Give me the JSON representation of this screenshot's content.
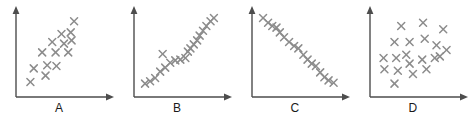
{
  "figure": {
    "background_color": "#ffffff",
    "marker_color": "#8c8c8c",
    "axis_color": "#4d4d4d",
    "label_color": "#1a1a1a",
    "marker_glyph": "x-cross",
    "panel_count": 4
  },
  "chart_data": [
    {
      "type": "scatter",
      "title": "A",
      "xlabel": "",
      "ylabel": "",
      "xlim": [
        0,
        100
      ],
      "ylim": [
        0,
        100
      ],
      "grid": false,
      "legend": "none",
      "annotation": "moderate positive correlation",
      "points": [
        {
          "x": 10,
          "y": 10
        },
        {
          "x": 14,
          "y": 27
        },
        {
          "x": 28,
          "y": 18
        },
        {
          "x": 30,
          "y": 31
        },
        {
          "x": 41,
          "y": 30
        },
        {
          "x": 24,
          "y": 47
        },
        {
          "x": 40,
          "y": 47
        },
        {
          "x": 55,
          "y": 47
        },
        {
          "x": 36,
          "y": 60
        },
        {
          "x": 50,
          "y": 58
        },
        {
          "x": 47,
          "y": 70
        },
        {
          "x": 58,
          "y": 72
        },
        {
          "x": 62,
          "y": 86
        },
        {
          "x": 59,
          "y": 62
        }
      ]
    },
    {
      "type": "scatter",
      "title": "B",
      "xlabel": "",
      "ylabel": "",
      "xlim": [
        0,
        100
      ],
      "ylim": [
        0,
        100
      ],
      "grid": false,
      "legend": "none",
      "annotation": "strong positive correlation",
      "points": [
        {
          "x": 6,
          "y": 8
        },
        {
          "x": 12,
          "y": 11
        },
        {
          "x": 18,
          "y": 15
        },
        {
          "x": 24,
          "y": 23
        },
        {
          "x": 30,
          "y": 28
        },
        {
          "x": 27,
          "y": 45
        },
        {
          "x": 36,
          "y": 34
        },
        {
          "x": 42,
          "y": 37
        },
        {
          "x": 48,
          "y": 38
        },
        {
          "x": 54,
          "y": 40
        },
        {
          "x": 57,
          "y": 48
        },
        {
          "x": 60,
          "y": 52
        },
        {
          "x": 64,
          "y": 57
        },
        {
          "x": 68,
          "y": 62
        },
        {
          "x": 71,
          "y": 68
        },
        {
          "x": 75,
          "y": 74
        },
        {
          "x": 79,
          "y": 80
        },
        {
          "x": 84,
          "y": 86
        },
        {
          "x": 88,
          "y": 90
        }
      ]
    },
    {
      "type": "scatter",
      "title": "C",
      "xlabel": "",
      "ylabel": "",
      "xlim": [
        0,
        100
      ],
      "ylim": [
        0,
        100
      ],
      "grid": false,
      "legend": "none",
      "annotation": "strong negative correlation",
      "points": [
        {
          "x": 6,
          "y": 90
        },
        {
          "x": 12,
          "y": 84
        },
        {
          "x": 17,
          "y": 80
        },
        {
          "x": 22,
          "y": 78
        },
        {
          "x": 26,
          "y": 72
        },
        {
          "x": 31,
          "y": 66
        },
        {
          "x": 37,
          "y": 60
        },
        {
          "x": 43,
          "y": 55
        },
        {
          "x": 48,
          "y": 52
        },
        {
          "x": 54,
          "y": 44
        },
        {
          "x": 59,
          "y": 38
        },
        {
          "x": 64,
          "y": 33
        },
        {
          "x": 69,
          "y": 30
        },
        {
          "x": 74,
          "y": 22
        },
        {
          "x": 79,
          "y": 16
        },
        {
          "x": 84,
          "y": 12
        },
        {
          "x": 90,
          "y": 9
        }
      ]
    },
    {
      "type": "scatter",
      "title": "D",
      "xlabel": "",
      "ylabel": "",
      "xlim": [
        0,
        100
      ],
      "ylim": [
        0,
        100
      ],
      "grid": false,
      "legend": "none",
      "annotation": "no correlation",
      "points": [
        {
          "x": 22,
          "y": 8
        },
        {
          "x": 10,
          "y": 26
        },
        {
          "x": 26,
          "y": 24
        },
        {
          "x": 44,
          "y": 20
        },
        {
          "x": 60,
          "y": 26
        },
        {
          "x": 9,
          "y": 40
        },
        {
          "x": 24,
          "y": 40
        },
        {
          "x": 36,
          "y": 44
        },
        {
          "x": 40,
          "y": 33
        },
        {
          "x": 55,
          "y": 38
        },
        {
          "x": 70,
          "y": 40
        },
        {
          "x": 76,
          "y": 42
        },
        {
          "x": 22,
          "y": 60
        },
        {
          "x": 40,
          "y": 60
        },
        {
          "x": 58,
          "y": 64
        },
        {
          "x": 72,
          "y": 56
        },
        {
          "x": 84,
          "y": 50
        },
        {
          "x": 30,
          "y": 80
        },
        {
          "x": 56,
          "y": 84
        },
        {
          "x": 80,
          "y": 76
        }
      ]
    }
  ]
}
